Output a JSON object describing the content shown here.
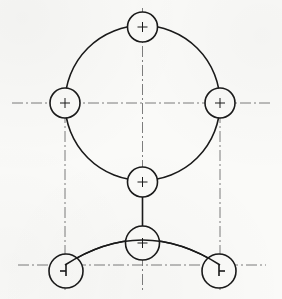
{
  "sheet": {
    "background_color": "#fafaf8",
    "width": 282,
    "height": 299,
    "title": "Geometric construction drawing",
    "line_color": "#1a1a1a",
    "centerline_color": "#6e6e6e"
  },
  "drawing": {
    "object_line_width": 1.6,
    "centerline_width": 0.9,
    "crosshair_width": 1.0,
    "crosshair_arm": 5,
    "centerline_dash": "11 3 2 3",
    "main_circle": {
      "label": "primary-circle",
      "cx": 142.5,
      "cy": 103,
      "r": 77.5
    },
    "bottom_arc": {
      "label": "lower-tangent-arc",
      "start_x": 65,
      "start_y": 265,
      "end_x": 220,
      "end_y": 265,
      "apex_x": 142.5,
      "apex_y": 240,
      "sweep_radius": 132
    },
    "node_circles": [
      {
        "name": "node-top",
        "cx": 142.5,
        "cy": 27,
        "r": 15,
        "crosshair": "plus"
      },
      {
        "name": "node-left",
        "cx": 65,
        "cy": 103,
        "r": 15,
        "crosshair": "plus"
      },
      {
        "name": "node-right",
        "cx": 220,
        "cy": 103,
        "r": 15,
        "crosshair": "plus"
      },
      {
        "name": "node-bottom-mid",
        "cx": 142.5,
        "cy": 182,
        "r": 15,
        "crosshair": "plus"
      },
      {
        "name": "node-arc-apex",
        "cx": 142.5,
        "cy": 243,
        "r": 17,
        "crosshair": "plus"
      },
      {
        "name": "node-arc-left",
        "cx": 66,
        "cy": 271,
        "r": 17,
        "crosshair": "arrow-left"
      },
      {
        "name": "node-arc-right",
        "cx": 219,
        "cy": 271,
        "r": 17,
        "crosshair": "arrow-right"
      }
    ],
    "centerlines": [
      {
        "name": "centerline-horizontal-main",
        "x1": 12,
        "y1": 103,
        "x2": 272,
        "y2": 103
      },
      {
        "name": "centerline-vertical-main",
        "x1": 142.5,
        "y1": 8,
        "x2": 142.5,
        "y2": 290
      },
      {
        "name": "centerline-vertical-left",
        "x1": 65,
        "y1": 112,
        "x2": 65,
        "y2": 290
      },
      {
        "name": "centerline-vertical-right",
        "x1": 220,
        "y1": 112,
        "x2": 220,
        "y2": 290
      },
      {
        "name": "centerline-horizontal-lower",
        "x1": 18,
        "y1": 265,
        "x2": 266,
        "y2": 265
      }
    ],
    "connector_lines": [
      {
        "name": "connector-mid-to-apex",
        "x1": 142.5,
        "y1": 197,
        "x2": 142.5,
        "y2": 226
      }
    ]
  }
}
